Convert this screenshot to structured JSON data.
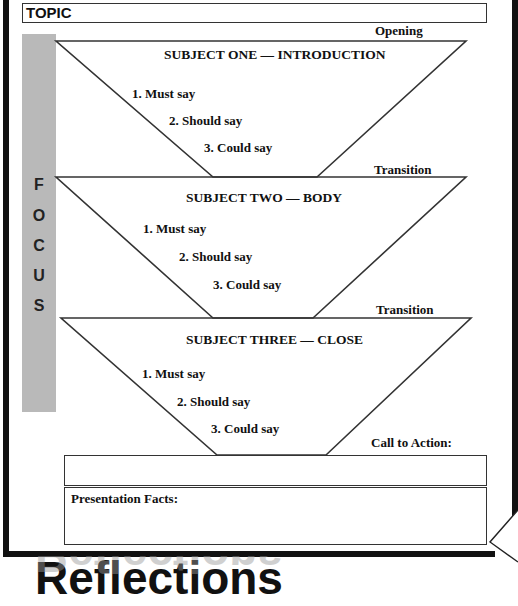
{
  "topic": {
    "label": "TOPIC",
    "value": ""
  },
  "focus": {
    "letters": [
      "F",
      "O",
      "C",
      "U",
      "S"
    ]
  },
  "sections": [
    {
      "marker": "Opening",
      "title": "SUBJECT ONE — INTRODUCTION",
      "items": [
        "1.  Must say",
        "2.  Should say",
        "3.  Could say"
      ]
    },
    {
      "marker": "Transition",
      "title": "SUBJECT TWO — BODY",
      "items": [
        "1.  Must say",
        "2.  Should say",
        "3.  Could say"
      ]
    },
    {
      "marker": "Transition",
      "title": "SUBJECT THREE — CLOSE",
      "items": [
        "1.  Must say",
        "2.  Should say",
        "3.  Could say"
      ]
    }
  ],
  "call_to_action": {
    "label": "Call to Action:",
    "value": ""
  },
  "presentation_facts": {
    "label": "Presentation Facts:",
    "value": ""
  },
  "footer": {
    "heading": "Reflections"
  },
  "colors": {
    "frame": "#111111",
    "focus_bar": "#b9b9b9",
    "line": "#333333"
  }
}
